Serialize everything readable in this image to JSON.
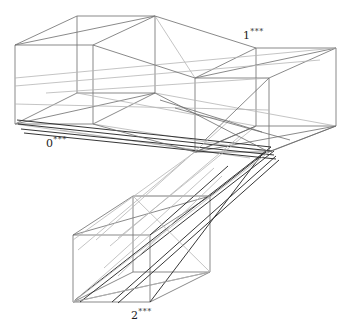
{
  "figure": {
    "title": "",
    "background_color": "#ffffff",
    "width": 346,
    "height": 331
  },
  "labels": [
    {
      "id": "label-0",
      "base": "0",
      "superscript": "***",
      "x": 46,
      "y": 136
    },
    {
      "id": "label-1",
      "base": "1",
      "superscript": "***",
      "x": 243,
      "y": 28
    },
    {
      "id": "label-2",
      "base": "2",
      "superscript": "***",
      "x": 131,
      "y": 308
    }
  ],
  "colors": {
    "stroke_dark": "#2b2b2b",
    "stroke_medium": "#6b6b6b",
    "stroke_light": "#b5b5b5",
    "stroke_box": "#757575",
    "text": "#1c1c1c",
    "background": "#ffffff"
  },
  "stroke_widths": {
    "dark": 0.95,
    "medium": 0.8,
    "light": 0.8,
    "box": 0.85
  },
  "boxes": [
    {
      "name": "box-0",
      "label": "0***",
      "front_face": [
        [
          15,
          45
        ],
        [
          93,
          45
        ],
        [
          93,
          124
        ],
        [
          15,
          124
        ]
      ],
      "back_face": [
        [
          77,
          16
        ],
        [
          155,
          16
        ],
        [
          155,
          93
        ],
        [
          77,
          93
        ]
      ]
    },
    {
      "name": "box-1",
      "label": "1***",
      "front_face": [
        [
          256,
          48
        ],
        [
          336,
          48
        ],
        [
          336,
          126
        ],
        [
          256,
          126
        ]
      ],
      "back_face": [
        [
          195,
          78
        ],
        [
          269,
          78
        ],
        [
          269,
          152
        ],
        [
          195,
          152
        ]
      ]
    },
    {
      "name": "box-2",
      "label": "2***",
      "front_face": [
        [
          73,
          235
        ],
        [
          150,
          235
        ],
        [
          150,
          302
        ],
        [
          73,
          302
        ]
      ],
      "back_face": [
        [
          133,
          196
        ],
        [
          210,
          196
        ],
        [
          210,
          272
        ],
        [
          133,
          272
        ]
      ]
    }
  ],
  "connector_lines": {
    "description": "Bundles of straight lines linking corresponding vertices of the three boxes",
    "dark_bundle_count": 6,
    "light_bundle_count": 10
  }
}
